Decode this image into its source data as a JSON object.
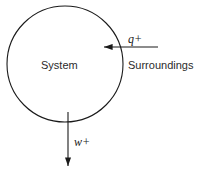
{
  "diagram": {
    "background_color": "#ffffff",
    "stroke_color": "#1a1a1a",
    "system": {
      "shape": "circle",
      "label": "System",
      "center_x": 65,
      "center_y": 64,
      "radius": 58,
      "fill": "none",
      "stroke_width": 1.1
    },
    "surroundings": {
      "label": "Surroundings"
    },
    "arrows": [
      {
        "name": "heat-arrow",
        "label": "q+",
        "direction": "left",
        "meaning": "heat added to system is positive",
        "from_x": 158,
        "from_y": 47,
        "to_x": 101,
        "to_y": 47
      },
      {
        "name": "work-arrow",
        "label": "w+",
        "direction": "down",
        "meaning": "work done by system is positive",
        "from_x": 68,
        "from_y": 112,
        "to_x": 68,
        "to_y": 170
      }
    ]
  }
}
